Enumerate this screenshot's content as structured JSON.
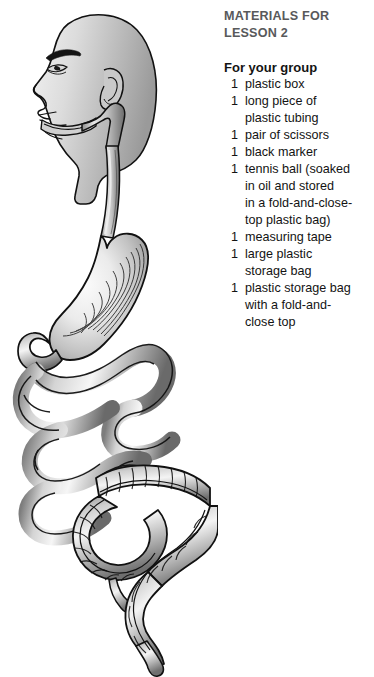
{
  "page": {
    "background_color": "#ffffff",
    "width": 374,
    "height": 677
  },
  "materials": {
    "heading_line_1": "MATERIALS FOR",
    "heading_line_2": "LESSON 2",
    "heading_color": "#58595b",
    "subheading": "For your group",
    "items": [
      {
        "qty": "1",
        "lines": [
          "plastic box"
        ]
      },
      {
        "qty": "1",
        "lines": [
          "long piece of",
          "plastic tubing"
        ]
      },
      {
        "qty": "1",
        "lines": [
          "pair of scissors"
        ]
      },
      {
        "qty": "1",
        "lines": [
          "black marker"
        ]
      },
      {
        "qty": "1",
        "lines": [
          "tennis ball (soaked",
          "in oil and stored",
          "in a fold-and-close-",
          "top plastic bag)"
        ]
      },
      {
        "qty": "1",
        "lines": [
          "measuring tape"
        ]
      },
      {
        "qty": "1",
        "lines": [
          "large plastic",
          "storage bag"
        ]
      },
      {
        "qty": "1",
        "lines": [
          "plastic storage bag",
          "with a fold-and-",
          "close top"
        ]
      }
    ]
  },
  "illustration": {
    "title": "human digestive system",
    "parts": [
      "head-profile",
      "mouth",
      "pharynx",
      "esophagus",
      "stomach",
      "duodenum",
      "small-intestine",
      "large-intestine",
      "appendix",
      "rectum"
    ],
    "colors": {
      "outline": "#111111",
      "fill_light": "#ffffff",
      "fill_mid": "#b9b9b9",
      "fill_dark": "#6e6e6e",
      "skin_light": "#e6e6e6",
      "skin_mid": "#b3b3b3"
    }
  }
}
